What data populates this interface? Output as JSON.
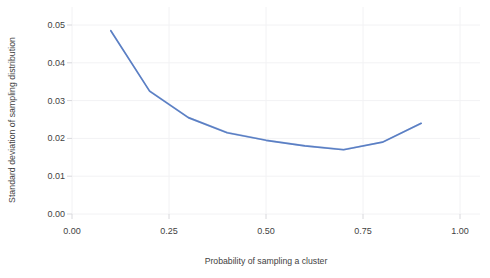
{
  "chart_data": {
    "type": "line",
    "title": "",
    "xlabel": "Probability of sampling a cluster",
    "ylabel": "Standard deviation of sampling distribution",
    "xlim": [
      0.0,
      1.0
    ],
    "ylim": [
      0.0,
      0.05
    ],
    "grid": true,
    "legend": "none",
    "xticklabels": [
      "0.00",
      "0.25",
      "0.50",
      "0.75",
      "1.00"
    ],
    "xtickvalues": [
      0.0,
      0.25,
      0.5,
      0.75,
      1.0
    ],
    "yticklabels": [
      "0.00",
      "0.01",
      "0.02",
      "0.03",
      "0.04",
      "0.05"
    ],
    "ytickvalues": [
      0.0,
      0.01,
      0.02,
      0.03,
      0.04,
      0.05
    ],
    "x": [
      0.1,
      0.2,
      0.3,
      0.4,
      0.5,
      0.6,
      0.7,
      0.8,
      0.9
    ],
    "series": [
      {
        "name": "Standard deviation of sampling distribution",
        "values": [
          0.0485,
          0.0325,
          0.0255,
          0.0215,
          0.0195,
          0.018,
          0.017,
          0.019,
          0.024
        ],
        "band_low": [
          0.0482,
          0.0322,
          0.0252,
          0.0212,
          0.0193,
          0.0178,
          0.0168,
          0.0188,
          0.0237
        ],
        "band_high": [
          0.0489,
          0.0329,
          0.0258,
          0.0218,
          0.0198,
          0.0183,
          0.0173,
          0.0192,
          0.0243
        ],
        "color": "#5b7fc4",
        "band_color": "#aec4e6"
      }
    ]
  },
  "style": {
    "background": "#ffffff",
    "grid_color": "#f2f2f4",
    "tick_color": "#d8d8dc",
    "text_color": "#3f3f3f"
  }
}
